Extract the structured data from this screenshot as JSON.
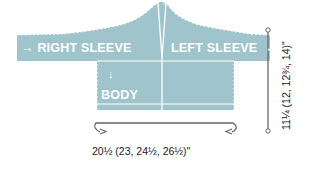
{
  "diagram": {
    "type": "knitting-schematic",
    "colors": {
      "fill": "#9fc4cc",
      "line_light": "#ffffff",
      "dimension_line": "#666666",
      "text_dark": "#222222"
    },
    "pieces": {
      "right_sleeve": {
        "label": "RIGHT SLEEVE",
        "arrow": "→"
      },
      "left_sleeve": {
        "label": "LEFT SLEEVE",
        "arrow": "←"
      },
      "body": {
        "label": "BODY",
        "arrow": "↓"
      }
    },
    "dimensions": {
      "width": "20½ (23, 24½, 26½)\"",
      "length": "11¼ (12, 12¾, 14)\""
    }
  }
}
